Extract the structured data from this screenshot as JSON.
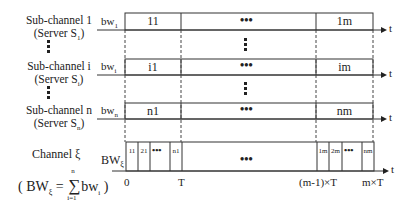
{
  "rows": [
    {
      "label": "Sub-channel 1",
      "server": "(Server S",
      "server_sub": "1",
      "bw": "bw",
      "bw_sub": "1",
      "first": "11",
      "last": "1m"
    },
    {
      "label": "Sub-channel i",
      "server": "(Server S",
      "server_sub": "i",
      "bw": "bw",
      "bw_sub": "i",
      "first": "i1",
      "last": "im"
    },
    {
      "label": "Sub-channel n",
      "server": "(Server S",
      "server_sub": "n",
      "bw": "bw",
      "bw_sub": "n",
      "first": "n1",
      "last": "nm"
    }
  ],
  "channel": {
    "label": "Channel ξ",
    "bw": "BW",
    "bw_sub": "ξ",
    "first_cells": [
      "11",
      "21",
      "n1"
    ],
    "last_cells": [
      "1m",
      "2m",
      "nm"
    ],
    "formula": {
      "open": "( BW",
      "sub": "ξ",
      "eq": "=",
      "sum_top": "n",
      "sum_bottom": "i=1",
      "term": "bw",
      "term_sub": "i",
      "close": ")"
    }
  },
  "axis": {
    "arrow_label": "t",
    "ticks": [
      "0",
      "T",
      "(m-1)×T",
      "m×T"
    ]
  },
  "ellipsis": "•••",
  "close_paren": ")"
}
